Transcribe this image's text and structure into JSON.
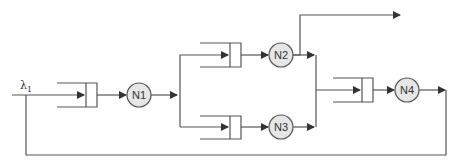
{
  "diagram": {
    "type": "queueing-network",
    "input_label": "λ",
    "input_subscript": "1",
    "line_color": "#555555",
    "node_fill": "#e6e6e6",
    "nodes": [
      {
        "id": "N1",
        "label": "N1"
      },
      {
        "id": "N2",
        "label": "N2"
      },
      {
        "id": "N3",
        "label": "N3"
      },
      {
        "id": "N4",
        "label": "N4"
      }
    ],
    "edges": [
      {
        "from": "input",
        "to": "queue-N1"
      },
      {
        "from": "N1",
        "to": "queue-N2"
      },
      {
        "from": "N1",
        "to": "queue-N3"
      },
      {
        "from": "N2",
        "to": "exit"
      },
      {
        "from": "N2",
        "to": "queue-N4"
      },
      {
        "from": "N3",
        "to": "queue-N4"
      },
      {
        "from": "N4",
        "to": "queue-N1",
        "kind": "feedback"
      }
    ]
  }
}
